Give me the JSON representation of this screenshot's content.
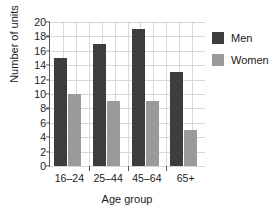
{
  "chart_data": {
    "type": "bar",
    "title": "",
    "xlabel": "Age group",
    "ylabel": "Number of units",
    "categories": [
      "16–24",
      "25–44",
      "45–64",
      "65+"
    ],
    "series": [
      {
        "name": "Men",
        "color": "#3d3d3f",
        "values": [
          15,
          17,
          19,
          13
        ]
      },
      {
        "name": "Women",
        "color": "#9a9a9c",
        "values": [
          10,
          9,
          9,
          5
        ]
      }
    ],
    "ylim": [
      0,
      20
    ],
    "ytick_step": 2,
    "yticks": [
      "20",
      "18",
      "16",
      "14",
      "12",
      "10",
      "8",
      "6",
      "4",
      "2",
      "0"
    ],
    "grid": true,
    "legend_position": "right"
  },
  "legend": {
    "entries": [
      {
        "label": "Men"
      },
      {
        "label": "Women"
      }
    ]
  }
}
